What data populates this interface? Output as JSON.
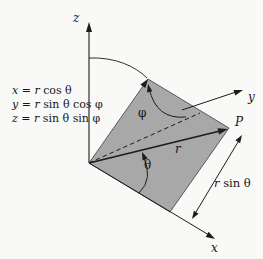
{
  "colors": {
    "background": "#f9f9f7",
    "plane_fill": "#a8a8a8",
    "plane_edge": "#4d4d4d",
    "ink": "#1c1c1c"
  },
  "equations": [
    {
      "tokens": [
        {
          "t": "x",
          "i": 1
        },
        {
          "t": " = ",
          "i": 0
        },
        {
          "t": "r",
          "i": 1
        },
        {
          "t": " cos θ",
          "i": 0
        }
      ]
    },
    {
      "tokens": [
        {
          "t": "y",
          "i": 1
        },
        {
          "t": " = ",
          "i": 0
        },
        {
          "t": "r",
          "i": 1
        },
        {
          "t": " sin θ cos φ",
          "i": 0
        }
      ]
    },
    {
      "tokens": [
        {
          "t": "z",
          "i": 1
        },
        {
          "t": " = ",
          "i": 0
        },
        {
          "t": "r",
          "i": 1
        },
        {
          "t": " sin θ sin φ",
          "i": 0
        }
      ]
    }
  ],
  "labels": {
    "z_axis": "z",
    "y_axis": "y",
    "x_axis": "x",
    "point": "P",
    "radius": "r",
    "phi": "φ",
    "theta": "θ",
    "r_sin_theta": {
      "tokens": [
        {
          "t": "r",
          "i": 1
        },
        {
          "t": " sin θ",
          "i": 0
        }
      ]
    }
  }
}
